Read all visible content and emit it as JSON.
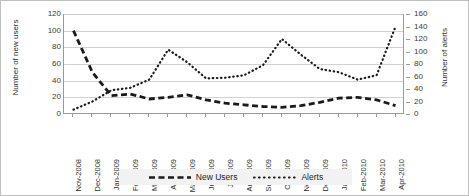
{
  "chart_data": {
    "type": "line",
    "title": "",
    "xlabel": "",
    "grid": true,
    "legend_position": "bottom",
    "categories": [
      "Nov-2008",
      "Dec-2008",
      "Jan-2009",
      "Feb-2009",
      "Mar-2009",
      "Apr-2009",
      "May-2009",
      "Jun-2009",
      "Jul-2009",
      "Aug-2009",
      "Sep-2009",
      "Oct-2009",
      "Nov-2009",
      "Dec-2009",
      "Jan-2010",
      "Feb-2010",
      "Mar-2010",
      "Apr-2010"
    ],
    "axes": {
      "left": {
        "label": "Number of new users",
        "ticks": [
          0,
          20,
          40,
          60,
          80,
          100,
          120
        ],
        "ylim": [
          0,
          120
        ]
      },
      "right": {
        "label": "Number of alerts",
        "ticks": [
          0,
          20,
          40,
          60,
          80,
          100,
          120,
          140,
          160
        ],
        "ylim": [
          0,
          160
        ]
      }
    },
    "series": [
      {
        "name": "New Users",
        "axis": "left",
        "style": "dashed",
        "color": "#1a1a1a",
        "values": [
          100,
          50,
          22,
          24,
          18,
          20,
          23,
          17,
          13,
          11,
          9,
          8,
          10,
          14,
          19,
          20,
          17,
          10
        ]
      },
      {
        "name": "Alerts",
        "axis": "right",
        "style": "dotted",
        "color": "#1a1a1a",
        "values": [
          7,
          20,
          38,
          42,
          55,
          103,
          83,
          57,
          58,
          62,
          78,
          120,
          95,
          72,
          67,
          55,
          62,
          140
        ]
      }
    ]
  },
  "legend": {
    "items": [
      {
        "label": "New Users"
      },
      {
        "label": "Alerts"
      }
    ]
  }
}
